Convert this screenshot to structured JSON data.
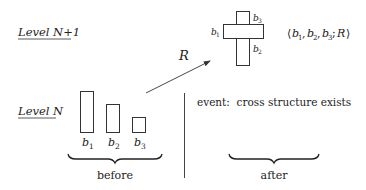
{
  "levels": {
    "upper": "Level N+1",
    "lower": "Level N"
  },
  "before": {
    "bars": [
      {
        "label": "b",
        "sub": "1",
        "height": 41
      },
      {
        "label": "b",
        "sub": "2",
        "height": 28
      },
      {
        "label": "b",
        "sub": "3",
        "height": 15
      }
    ],
    "caption": "before"
  },
  "relation": {
    "label": "R"
  },
  "cross": {
    "label_left": {
      "base": "b",
      "sub": "1"
    },
    "label_top": {
      "base": "b",
      "sub": "3"
    },
    "label_bottom": {
      "base": "b",
      "sub": "2"
    },
    "tuple": {
      "open": "⟨",
      "items": [
        {
          "base": "b",
          "sub": "1"
        },
        {
          "base": "b",
          "sub": "2"
        },
        {
          "base": "b",
          "sub": "3"
        }
      ],
      "relation": "R",
      "close": "⟩"
    }
  },
  "after": {
    "event_text": "event:  cross structure exists",
    "caption": "after"
  },
  "colors": {
    "stroke": "#333333",
    "text": "#222222",
    "background": "#ffffff"
  }
}
